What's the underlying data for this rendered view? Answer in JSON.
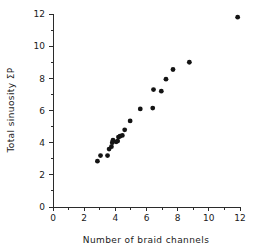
{
  "chart_data": {
    "type": "scatter",
    "title": "",
    "xlabel": "Number of braid channels",
    "ylabel": "Total sinuosity ΣP",
    "xlim": [
      0,
      12
    ],
    "ylim": [
      0,
      12
    ],
    "xticks": [
      0,
      2,
      4,
      6,
      8,
      10,
      12
    ],
    "xtick_labels": [
      "0",
      "2",
      "4",
      "6",
      "8",
      "10",
      "12"
    ],
    "xminor_ticks": [
      1,
      3,
      5,
      7,
      9,
      11
    ],
    "yticks": [
      0,
      2,
      4,
      6,
      8,
      10,
      12
    ],
    "ytick_labels": [
      "0",
      "2",
      "4",
      "6",
      "8",
      "10",
      "12"
    ],
    "yminor_ticks": [
      1,
      3,
      5,
      7,
      9,
      11
    ],
    "grid": false,
    "legend": false,
    "marker": "filled-circle",
    "marker_color": "#141414",
    "points": [
      {
        "x": 2.85,
        "y": 2.85
      },
      {
        "x": 3.05,
        "y": 3.2
      },
      {
        "x": 3.5,
        "y": 3.2
      },
      {
        "x": 3.6,
        "y": 3.6
      },
      {
        "x": 3.75,
        "y": 3.75
      },
      {
        "x": 3.8,
        "y": 4.0
      },
      {
        "x": 3.85,
        "y": 4.15
      },
      {
        "x": 4.05,
        "y": 4.05
      },
      {
        "x": 4.15,
        "y": 4.1
      },
      {
        "x": 4.2,
        "y": 4.35
      },
      {
        "x": 4.3,
        "y": 4.4
      },
      {
        "x": 4.45,
        "y": 4.45
      },
      {
        "x": 4.6,
        "y": 4.8
      },
      {
        "x": 4.95,
        "y": 5.35
      },
      {
        "x": 5.6,
        "y": 6.1
      },
      {
        "x": 6.4,
        "y": 6.15
      },
      {
        "x": 6.45,
        "y": 7.3
      },
      {
        "x": 6.95,
        "y": 7.2
      },
      {
        "x": 7.25,
        "y": 7.95
      },
      {
        "x": 7.7,
        "y": 8.55
      },
      {
        "x": 8.75,
        "y": 9.0
      },
      {
        "x": 11.85,
        "y": 11.8
      }
    ]
  },
  "axes": {
    "x_axis_name": "x-axis",
    "y_axis_name": "y-axis"
  }
}
